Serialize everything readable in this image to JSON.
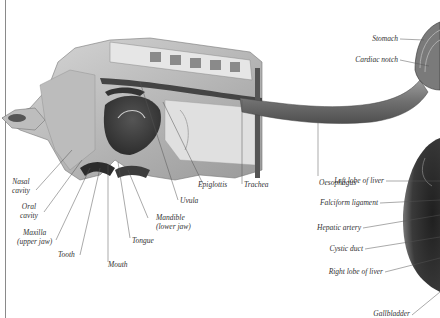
{
  "diagram": {
    "type": "anatomical illustration",
    "labels": {
      "nasal_cavity": [
        "Nasal",
        "cavity"
      ],
      "oral_cavity": [
        "Oral",
        "cavity"
      ],
      "maxilla": [
        "Maxilla",
        "(upper jaw)"
      ],
      "tooth": "Tooth",
      "mouth": "Mouth",
      "tongue": "Tongue",
      "mandible": [
        "Mandible",
        "(lower jaw)"
      ],
      "uvula": "Uvula",
      "epiglottis": "Epiglottis",
      "trachea": "Trachea",
      "oesophagus": "Oesophagus",
      "stomach": "Stomach",
      "cardiac_notch": "Cardiac notch",
      "left_lobe_of_liver": "Left lobe of liver",
      "falciform_ligament": "Falciform ligament",
      "hepatic_artery": "Hepatic artery",
      "cystic_duct": "Cystic duct",
      "right_lobe_of_liver": "Right lobe of liver",
      "gallbladder": "Gallbladder"
    }
  }
}
